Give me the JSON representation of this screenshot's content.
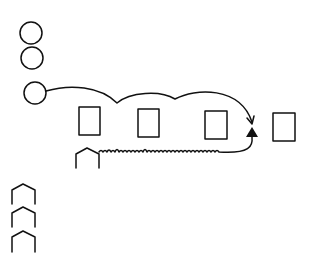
{
  "diagram": {
    "background": "#ffffff",
    "stroke_color": "#111111",
    "circles": [
      {
        "id": "circle-1",
        "cx": 31,
        "cy": 33,
        "r": 11
      },
      {
        "id": "circle-2",
        "cx": 32,
        "cy": 58,
        "r": 11
      },
      {
        "id": "circle-3",
        "cx": 35,
        "cy": 93,
        "r": 11
      }
    ],
    "rectangles": [
      {
        "id": "rect-1",
        "x": 79,
        "y": 107,
        "w": 21,
        "h": 28
      },
      {
        "id": "rect-2",
        "x": 138,
        "y": 109,
        "w": 21,
        "h": 28
      },
      {
        "id": "rect-3",
        "x": 205,
        "y": 111,
        "w": 22,
        "h": 28
      },
      {
        "id": "rect-4",
        "x": 273,
        "y": 113,
        "w": 22,
        "h": 28
      }
    ],
    "houses": [
      {
        "id": "house-main",
        "x": 76,
        "y": 148,
        "w": 23,
        "h": 20
      },
      {
        "id": "house-stack-1",
        "x": 12,
        "y": 184,
        "w": 23,
        "h": 20
      },
      {
        "id": "house-stack-2",
        "x": 12,
        "y": 207,
        "w": 23,
        "h": 20
      },
      {
        "id": "house-stack-3",
        "x": 12,
        "y": 231,
        "w": 23,
        "h": 21
      }
    ],
    "arrowhead": {
      "tip_x": 252,
      "tip_y": 130
    }
  }
}
